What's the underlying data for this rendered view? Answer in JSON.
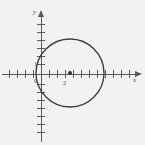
{
  "figure": {
    "type": "coordinate-plane-circle-graph",
    "background_color": "#f2f2f2",
    "ink_color": "#3c3c3c",
    "axis_color": "#5a5a5a",
    "width": 145,
    "height": 145
  },
  "axes": {
    "x_label": "x",
    "y_label": "y",
    "origin_label": "0",
    "x_axis_pixel_y": 74,
    "y_axis_pixel_x": 41,
    "tick_spacing_px": 8,
    "x_tick_count_left": 5,
    "x_tick_count_right": 12,
    "y_tick_count_up": 8,
    "y_tick_count_down": 8,
    "x_tick_labels": [
      {
        "text": "2",
        "value": 2,
        "px": 65,
        "py": 82
      }
    ],
    "y_tick_labels": [
      {
        "text": "1",
        "value": 1,
        "px": 36,
        "py": 64
      }
    ]
  },
  "chart_data": {
    "type": "scatter",
    "title": "",
    "xlabel": "x",
    "ylabel": "y",
    "grid": false,
    "legend": null,
    "shapes": [
      {
        "name": "circle",
        "kind": "circle",
        "center_px": [
          70,
          73
        ],
        "radius_px": 34,
        "center_units": [
          3.6,
          0.1
        ],
        "radius_units": 4.25,
        "stroke": "#3c3c3c"
      }
    ],
    "points": [
      {
        "name": "circle-center",
        "px": [
          70,
          73
        ],
        "units": [
          3.6,
          0.1
        ],
        "marker": "filled-dot",
        "color": "#2e2e2e"
      }
    ],
    "annotations": [
      {
        "text": "x",
        "px": 137,
        "py": 78,
        "role": "axis-name"
      },
      {
        "text": "y",
        "px": 36,
        "py": 11,
        "role": "axis-name"
      },
      {
        "text": "0",
        "px": 36,
        "py": 81,
        "role": "origin-label"
      },
      {
        "text": "1",
        "px": 36,
        "py": 64,
        "role": "y-tick-label"
      },
      {
        "text": "2",
        "px": 65,
        "py": 82,
        "role": "x-tick-label"
      }
    ]
  }
}
